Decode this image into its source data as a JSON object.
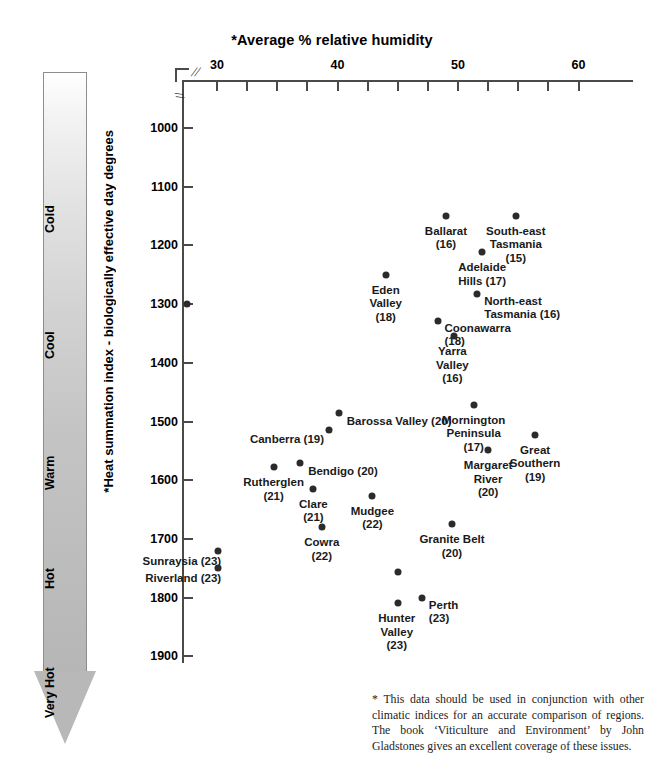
{
  "chart_data": {
    "type": "scatter",
    "title": "*Average % relative humidity",
    "xlabel": "*Average % relative humidity",
    "ylabel": "*Heat summation index - biologically effective day degrees",
    "xlim": [
      27,
      64.5
    ],
    "ylim": [
      950,
      1900
    ],
    "y_inverted": true,
    "grid": false,
    "legend": null,
    "x_ticks": [
      30,
      40,
      50,
      60
    ],
    "x_minor_ticks": [
      30,
      32.5,
      35,
      37.5,
      40,
      42.5,
      45,
      47.5,
      50,
      52.5,
      55,
      57.5,
      60
    ],
    "y_ticks": [
      1000,
      1100,
      1200,
      1300,
      1400,
      1500,
      1600,
      1700,
      1800,
      1900
    ],
    "axis_break_x": true,
    "axis_break_y": true,
    "point_label_note": "Number in parentheses is the average temperature index for the region",
    "points": [
      {
        "name": "Ballarat",
        "label": "Ballarat\n(16)",
        "x": 49.0,
        "y": 1150,
        "value": 16,
        "align": "c",
        "dx": 0,
        "dy": 9
      },
      {
        "name": "South-east Tasmania",
        "label": "South-east\nTasmania\n(15)",
        "x": 54.8,
        "y": 1150,
        "value": 15,
        "align": "c",
        "dx": 0,
        "dy": 9
      },
      {
        "name": "Adelaide Hills",
        "label": "Adelaide\nHills (17)",
        "x": 52.0,
        "y": 1212,
        "value": 17,
        "align": "c",
        "dx": 0,
        "dy": 9
      },
      {
        "name": "Eden Valley",
        "label": "Eden\nValley\n(18)",
        "x": 44.0,
        "y": 1250,
        "value": 18,
        "align": "c",
        "dx": 0,
        "dy": 9
      },
      {
        "name": "North-east Tasmania",
        "label": "North-east\nTasmania (16)",
        "x": 51.6,
        "y": 1282,
        "value": 16,
        "align": "l",
        "dx": 7,
        "dy": 1
      },
      {
        "name": "Unlabelled-1300",
        "label": "",
        "x": 27.5,
        "y": 1300,
        "value": null,
        "align": "c",
        "dx": 0,
        "dy": 9
      },
      {
        "name": "Coonawarra",
        "label": "Coonawarra\n(18)",
        "x": 48.3,
        "y": 1328,
        "value": 18,
        "align": "l",
        "dx": 7,
        "dy": 1
      },
      {
        "name": "Yarra Valley",
        "label": "Yarra\nValley\n(16)",
        "x": 49.7,
        "y": 1355,
        "value": 16,
        "align": "c",
        "dx": -2,
        "dy": 9
      },
      {
        "name": "Barossa Valley",
        "label": "Barossa Valley (20)",
        "x": 40.1,
        "y": 1485,
        "value": 20,
        "align": "l",
        "dx": 8,
        "dy": 2
      },
      {
        "name": "Canberra",
        "label": "Canberra (19)",
        "x": 39.3,
        "y": 1515,
        "value": 19,
        "align": "r",
        "dx": -5,
        "dy": 3
      },
      {
        "name": "Mornington Peninsula",
        "label": "Mornington\nPeninsula\n(17)",
        "x": 51.3,
        "y": 1472,
        "value": 17,
        "align": "c",
        "dx": 0,
        "dy": 9
      },
      {
        "name": "Great Southern",
        "label": "Great\nSouthern\n(19)",
        "x": 56.4,
        "y": 1523,
        "value": 19,
        "align": "c",
        "dx": 0,
        "dy": 9
      },
      {
        "name": "Margaret River",
        "label": "Margaret\nRiver\n(20)",
        "x": 52.5,
        "y": 1549,
        "value": 20,
        "align": "c",
        "dx": 0,
        "dy": 9
      },
      {
        "name": "Bendigo",
        "label": "Bendigo (20)",
        "x": 36.9,
        "y": 1570,
        "value": 20,
        "align": "l",
        "dx": 8,
        "dy": 2
      },
      {
        "name": "Rutherglen",
        "label": "Rutherglen\n(21)",
        "x": 34.7,
        "y": 1578,
        "value": 21,
        "align": "c",
        "dx": 0,
        "dy": 9
      },
      {
        "name": "Clare",
        "label": "Clare\n(21)",
        "x": 38.0,
        "y": 1615,
        "value": 21,
        "align": "c",
        "dx": 0,
        "dy": 9
      },
      {
        "name": "Mudgee",
        "label": "Mudgee\n(22)",
        "x": 42.9,
        "y": 1627,
        "value": 22,
        "align": "c",
        "dx": 0,
        "dy": 9
      },
      {
        "name": "Cowra",
        "label": "Cowra\n(22)",
        "x": 38.7,
        "y": 1680,
        "value": 22,
        "align": "c",
        "dx": 0,
        "dy": 9
      },
      {
        "name": "Granite Belt",
        "label": "Granite Belt\n(20)",
        "x": 49.5,
        "y": 1675,
        "value": 20,
        "align": "c",
        "dx": 0,
        "dy": 9
      },
      {
        "name": "Sunraysia",
        "label": "Sunraysia (23)",
        "x": 30.1,
        "y": 1720,
        "value": 23,
        "align": "r",
        "dx": 3,
        "dy": 4
      },
      {
        "name": "Riverland",
        "label": "Riverland (23)",
        "x": 30.1,
        "y": 1750,
        "value": 23,
        "align": "r",
        "dx": 3,
        "dy": 4
      },
      {
        "name": "Unlabelled-1755",
        "label": "",
        "x": 45.0,
        "y": 1757,
        "value": null,
        "align": "c",
        "dx": 0,
        "dy": 9
      },
      {
        "name": "Hunter Valley",
        "label": "Hunter\nValley\n(23)",
        "x": 45.0,
        "y": 1810,
        "value": 23,
        "align": "c",
        "dx": -1,
        "dy": 9
      },
      {
        "name": "Perth",
        "label": "Perth\n(23)",
        "x": 47.0,
        "y": 1800,
        "value": 23,
        "align": "l",
        "dx": 7,
        "dy": 1
      }
    ]
  },
  "temperature_scale": {
    "bands": [
      {
        "label": "Cold",
        "top": 92,
        "height": 110
      },
      {
        "label": "Cool",
        "top": 218,
        "height": 110
      },
      {
        "label": "Warm",
        "top": 346,
        "height": 110
      },
      {
        "label": "Hot",
        "top": 462,
        "height": 90
      },
      {
        "label": "Very Hot",
        "top": 566,
        "height": 110
      }
    ]
  },
  "footnote": {
    "text": "* This data should be used in conjunction with other climatic indices for an accurate comparison of regions. The book ‘Viticulture and Environment’ by John Gladstones gives an excellent coverage of these issues."
  }
}
